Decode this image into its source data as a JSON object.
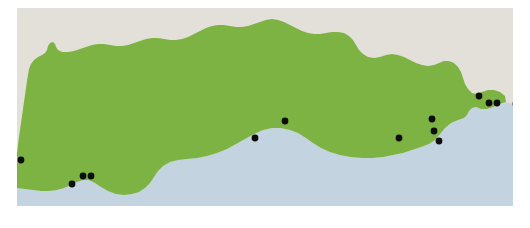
{
  "figure": {
    "title": "Distribution map",
    "width": 530,
    "height": 228
  },
  "map": {
    "name": "distribution-map",
    "projection_note": "plan view, no graticule",
    "background_color": "#ffffff",
    "layers": {
      "neighbouring_land": {
        "label": "Neighbouring land",
        "color": "#e2e0d8"
      },
      "region_land": {
        "label": "Region",
        "color": "#7cb342"
      },
      "sea": {
        "label": "Sea",
        "color": "#c3d3e0"
      }
    },
    "symbol": {
      "label": "Occurrence record",
      "shape": "filled-circle",
      "color": "#0d0d0d",
      "radius": 3.4
    }
  },
  "chart_data": {
    "type": "scatter",
    "title": "Distribution map",
    "xlabel": "",
    "ylabel": "",
    "xlim": [
      0,
      496
    ],
    "ylim": [
      0,
      198
    ],
    "grid": false,
    "legend": "none",
    "point_count": 13,
    "points": [
      {
        "id": 1,
        "x": 4,
        "y": 152,
        "group": "south-west"
      },
      {
        "id": 2,
        "x": 55,
        "y": 176,
        "group": "south-west"
      },
      {
        "id": 3,
        "x": 66,
        "y": 168,
        "group": "south-west"
      },
      {
        "id": 4,
        "x": 74,
        "y": 168,
        "group": "south-west"
      },
      {
        "id": 5,
        "x": 238,
        "y": 130,
        "group": "central"
      },
      {
        "id": 6,
        "x": 268,
        "y": 113,
        "group": "central"
      },
      {
        "id": 7,
        "x": 382,
        "y": 130,
        "group": "east"
      },
      {
        "id": 8,
        "x": 415,
        "y": 111,
        "group": "east"
      },
      {
        "id": 9,
        "x": 417,
        "y": 123,
        "group": "east"
      },
      {
        "id": 10,
        "x": 422,
        "y": 133,
        "group": "east"
      },
      {
        "id": 11,
        "x": 462,
        "y": 88,
        "group": "north-east"
      },
      {
        "id": 12,
        "x": 472,
        "y": 95,
        "group": "north-east"
      },
      {
        "id": 13,
        "x": 480,
        "y": 95,
        "group": "north-east"
      },
      {
        "id": 14,
        "x": 499,
        "y": 96,
        "group": "north-east"
      }
    ]
  }
}
